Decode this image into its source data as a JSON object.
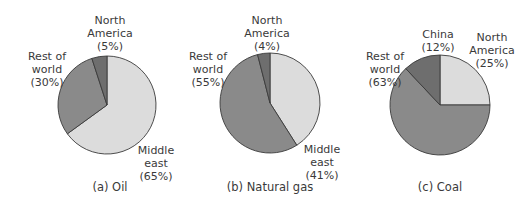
{
  "colors": {
    "light": "#dcdcdc",
    "medium": "#8a8a8a",
    "dark": "#6e6e6e",
    "edge": "#3a3a3a"
  },
  "chart_data": [
    {
      "type": "pie",
      "title": "(a) Oil",
      "labels": [
        "Middle east",
        "Rest of world",
        "North America"
      ],
      "values": [
        65,
        30,
        5
      ],
      "label_text": [
        {
          "lines": [
            "Middle",
            "east",
            "(65%)"
          ]
        },
        {
          "lines": [
            "Rest of",
            "world",
            "(30%)"
          ]
        },
        {
          "lines": [
            "North",
            "America",
            "(5%)"
          ]
        }
      ]
    },
    {
      "type": "pie",
      "title": "(b) Natural gas",
      "labels": [
        "Middle east",
        "Rest of world",
        "North America"
      ],
      "values": [
        41,
        55,
        4
      ],
      "label_text": [
        {
          "lines": [
            "Middle",
            "east",
            "(41%)"
          ]
        },
        {
          "lines": [
            "Rest of",
            "world",
            "(55%)"
          ]
        },
        {
          "lines": [
            "North",
            "America",
            "(4%)"
          ]
        }
      ]
    },
    {
      "type": "pie",
      "title": "(c) Coal",
      "labels": [
        "North America",
        "Rest of world",
        "China"
      ],
      "values": [
        25,
        63,
        12
      ],
      "label_text": [
        {
          "lines": [
            "North",
            "America",
            "(25%)"
          ]
        },
        {
          "lines": [
            "Rest of",
            "world",
            "(63%)"
          ]
        },
        {
          "lines": [
            "China",
            "(12%)"
          ]
        }
      ]
    }
  ]
}
